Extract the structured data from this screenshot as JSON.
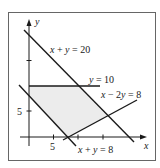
{
  "figure": {
    "type": "linear-programming feasible region",
    "axes": {
      "x_label": "x",
      "y_label": "y",
      "x_tick_label": "5",
      "y_tick_label": "5"
    },
    "lines": [
      {
        "id": "line-1",
        "label_parts": [
          "x",
          " + ",
          "y",
          " = 20"
        ],
        "equation": "x + y = 20"
      },
      {
        "id": "line-2",
        "label_parts": [
          "y",
          " = 10"
        ],
        "equation": "y = 10"
      },
      {
        "id": "line-3",
        "label_parts": [
          "x",
          " − 2",
          "y",
          " = 8"
        ],
        "equation": "x − 2y = 8"
      },
      {
        "id": "line-4",
        "label_parts": [
          "x",
          " + ",
          "y",
          " = 8"
        ],
        "equation": "x + y = 8"
      }
    ],
    "region": {
      "fill": "#ececec",
      "vertices": [
        [
          0,
          10
        ],
        [
          10,
          10
        ],
        [
          16,
          4
        ],
        [
          8,
          0
        ],
        [
          0,
          8
        ]
      ]
    },
    "colors": {
      "line": "#1a1a1a",
      "frame": "#555555",
      "shade": "#ececec"
    }
  }
}
